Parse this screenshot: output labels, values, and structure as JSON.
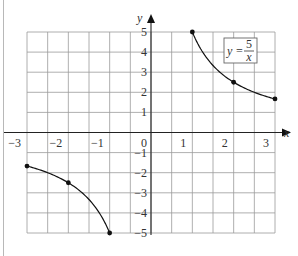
{
  "chart_data": {
    "type": "line",
    "title": "",
    "equation_label": {
      "lhs": "y =",
      "numerator": "5",
      "denominator": "x"
    },
    "xlabel": "x",
    "ylabel": "y",
    "xlim": [
      -3,
      3
    ],
    "ylim": [
      -5,
      5
    ],
    "grid": true,
    "grid_step_x": 0.5,
    "grid_step_y": 1,
    "x_ticks": [
      "-3",
      "-2",
      "-1",
      "0",
      "1",
      "2",
      "3"
    ],
    "y_ticks": [
      "5",
      "4",
      "3",
      "2",
      "1",
      "-1",
      "-2",
      "-3",
      "-4",
      "-5"
    ],
    "series": [
      {
        "name": "y = 5/x (x<0)",
        "x": [
          -3,
          -2,
          -1
        ],
        "y": [
          -1.67,
          -2.5,
          -5
        ],
        "points": [
          [
            -3,
            -1.67
          ],
          [
            -2,
            -2.5
          ],
          [
            -1,
            -5
          ]
        ]
      },
      {
        "name": "y = 5/x (x>0)",
        "x": [
          1,
          2,
          3
        ],
        "y": [
          5,
          2.5,
          1.67
        ],
        "points": [
          [
            1,
            5
          ],
          [
            2,
            2.5
          ],
          [
            3,
            1.67
          ]
        ]
      }
    ]
  }
}
